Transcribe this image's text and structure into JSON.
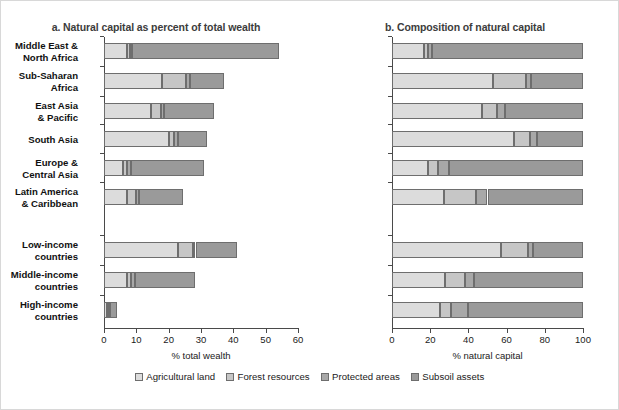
{
  "figure": {
    "width": 619,
    "height": 410
  },
  "legend": {
    "items": [
      {
        "label": "Agricultural land",
        "color": "#dcdcdc",
        "key": "agricultural_land"
      },
      {
        "label": "Forest resources",
        "color": "#c6c6c6",
        "key": "forest_resources"
      },
      {
        "label": "Protected areas",
        "color": "#a8a8a8",
        "key": "protected_areas"
      },
      {
        "label": "Subsoil assets",
        "color": "#9a9a9a",
        "key": "subsoil_assets"
      }
    ]
  },
  "categories": [
    "Middle East &\nNorth Africa",
    "Sub-Saharan\nAfrica",
    "East Asia\n& Pacific",
    "South Asia",
    "Europe &\nCentral Asia",
    "Latin America\n& Caribbean",
    "Low-income\ncountries",
    "Middle-income\ncountries",
    "High-income\ncountries"
  ],
  "chart_data": [
    {
      "type": "bar",
      "orientation": "horizontal",
      "stacked": true,
      "title": "a. Natural capital as percent of total wealth",
      "xlabel": "% total wealth",
      "ylabel": "",
      "xlim": [
        0,
        60
      ],
      "xticks": [
        0,
        10,
        20,
        30,
        40,
        50,
        60
      ],
      "grid": false,
      "legend_position": "bottom",
      "categories": [
        "Middle East & North Africa",
        "Sub-Saharan Africa",
        "East Asia & Pacific",
        "South Asia",
        "Europe & Central Asia",
        "Latin America & Caribbean",
        "Low-income countries",
        "Middle-income countries",
        "High-income countries"
      ],
      "series": [
        {
          "name": "Agricultural land",
          "values": [
            7.2,
            18.0,
            14.5,
            20.0,
            6.0,
            7.0,
            23.0,
            7.0,
            0.8
          ]
        },
        {
          "name": "Forest resources",
          "values": [
            0.9,
            7.5,
            3.0,
            1.5,
            1.0,
            3.0,
            4.5,
            1.5,
            0.5
          ]
        },
        {
          "name": "Protected areas",
          "values": [
            0.6,
            1.2,
            1.2,
            1.5,
            1.2,
            0.8,
            0.8,
            1.0,
            0.7
          ]
        },
        {
          "name": "Subsoil assets",
          "values": [
            45.3,
            10.3,
            15.3,
            9.0,
            22.8,
            13.7,
            12.7,
            18.5,
            2.0
          ]
        }
      ],
      "totals": [
        54.0,
        37.0,
        34.0,
        32.0,
        31.0,
        24.5,
        41.0,
        28.0,
        4.0
      ]
    },
    {
      "type": "bar",
      "orientation": "horizontal",
      "stacked": true,
      "title": "b. Composition of natural capital",
      "xlabel": "% natural capital",
      "ylabel": "",
      "xlim": [
        0,
        100
      ],
      "xticks": [
        0,
        20,
        40,
        60,
        80,
        100
      ],
      "grid": false,
      "legend_position": "bottom",
      "categories": [
        "Middle East & North Africa",
        "Sub-Saharan Africa",
        "East Asia & Pacific",
        "South Asia",
        "Europe & Central Asia",
        "Latin America & Caribbean",
        "Low-income countries",
        "Middle-income countries",
        "High-income countries"
      ],
      "series": [
        {
          "name": "Agricultural land",
          "values": [
            17,
            53,
            47,
            64,
            19,
            27,
            57,
            28,
            25
          ]
        },
        {
          "name": "Forest resources",
          "values": [
            2,
            17,
            8,
            8,
            5,
            17,
            14,
            10,
            6
          ]
        },
        {
          "name": "Protected areas",
          "values": [
            2,
            3,
            4,
            4,
            6,
            6,
            3,
            5,
            9
          ]
        },
        {
          "name": "Subsoil assets",
          "values": [
            79,
            27,
            41,
            24,
            70,
            50,
            26,
            57,
            60
          ]
        }
      ],
      "totals": [
        100,
        100,
        100,
        100,
        100,
        100,
        100,
        100,
        100
      ]
    }
  ]
}
